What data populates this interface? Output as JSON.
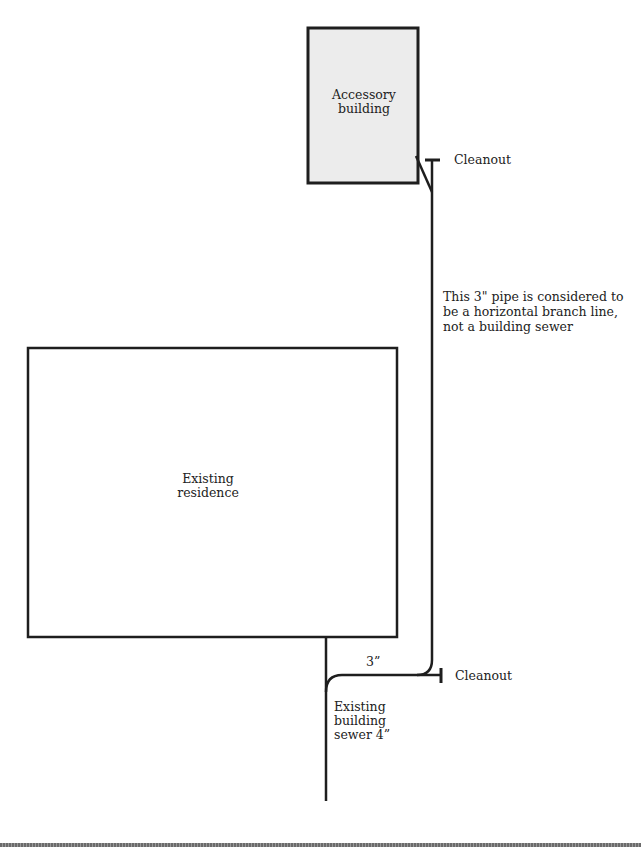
{
  "diagram": {
    "type": "plumbing-site-plan",
    "colors": {
      "line": "#1e1e1e",
      "accessory_fill": "#ececec",
      "residence_fill": "#ffffff",
      "rule": "#7a7a7a"
    },
    "buildings": {
      "accessory": {
        "label": "Accessory\nbuilding"
      },
      "residence": {
        "label": "Existing\nresidence"
      }
    },
    "pipes": {
      "branch_note": "This 3\" pipe is considered to\nbe a horizontal branch line,\nnot a building sewer",
      "branch_size_label": "3”",
      "sewer_label": "Existing\nbuilding\nsewer 4”"
    },
    "cleanouts": {
      "upper_label": "Cleanout",
      "lower_label": "Cleanout"
    }
  }
}
